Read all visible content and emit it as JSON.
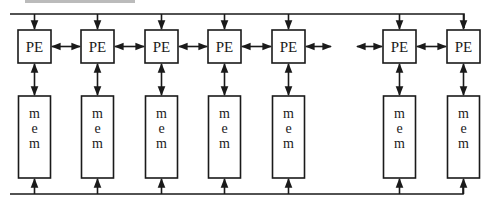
{
  "diagram": {
    "type": "architecture-block-diagram",
    "colors": {
      "stroke": "#1a1a1a",
      "background": "#ffffff"
    },
    "pe_label": "PE",
    "mem_label_lines": [
      "m",
      "e",
      "m"
    ],
    "columns": [
      {
        "id": "col-1",
        "pe": "PE",
        "mem": "mem",
        "x": 18
      },
      {
        "id": "col-2",
        "pe": "PE",
        "mem": "mem",
        "x": 81
      },
      {
        "id": "col-3",
        "pe": "PE",
        "mem": "mem",
        "x": 145
      },
      {
        "id": "col-4",
        "pe": "PE",
        "mem": "mem",
        "x": 208
      },
      {
        "id": "col-5",
        "pe": "PE",
        "mem": "mem",
        "x": 272
      },
      {
        "id": "col-6",
        "pe": "PE",
        "mem": "mem",
        "x": 383
      },
      {
        "id": "col-7",
        "pe": "PE",
        "mem": "mem",
        "x": 447
      }
    ],
    "connections": {
      "top_bus": "broadcast bus feeding each PE from above (arrows pointing down into PEs)",
      "bottom_bus": "bus feeding each memory from below (arrows pointing up into mem)",
      "pe_to_pe": "bidirectional arrows between adjacent PEs; gap with open-ended arrows between column 5 and column 6",
      "pe_to_mem": "bidirectional vertical arrow between each PE and its memory"
    }
  }
}
